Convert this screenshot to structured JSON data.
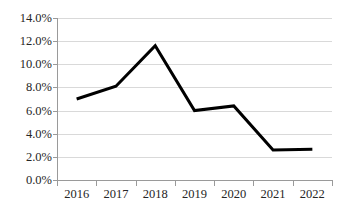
{
  "chart_data": {
    "type": "line",
    "title": "",
    "subtitle": "",
    "xlabel": "",
    "ylabel": "",
    "categories": [
      "2016",
      "2017",
      "2018",
      "2019",
      "2020",
      "2021",
      "2022"
    ],
    "x": [
      2016,
      2017,
      2018,
      2019,
      2020,
      2021,
      2022
    ],
    "series": [
      {
        "name": "",
        "values": [
          7.0,
          8.1,
          11.6,
          6.0,
          6.4,
          2.6,
          2.65
        ],
        "color": "#000000",
        "line_width": 3,
        "markers": false
      }
    ],
    "ylim": [
      0.0,
      14.0
    ],
    "ytick_values": [
      0.0,
      2.0,
      4.0,
      6.0,
      8.0,
      10.0,
      12.0,
      14.0
    ],
    "ytick_labels": [
      "0.0%",
      "2.0%",
      "4.0%",
      "6.0%",
      "8.0%",
      "10.0%",
      "12.0%",
      "14.0%"
    ],
    "value_format": "percent",
    "grid": {
      "horizontal": true,
      "vertical": false,
      "color": "#d9d9d9"
    },
    "legend": {
      "visible": false,
      "position": "none"
    },
    "axis": {
      "line_color": "#9a9a9a",
      "tick_marks": true
    },
    "annotations": []
  },
  "colors": {
    "background": "#ffffff",
    "series_line": "#000000",
    "gridline": "#d9d9d9",
    "axis": "#9a9a9a",
    "text": "#262626"
  }
}
